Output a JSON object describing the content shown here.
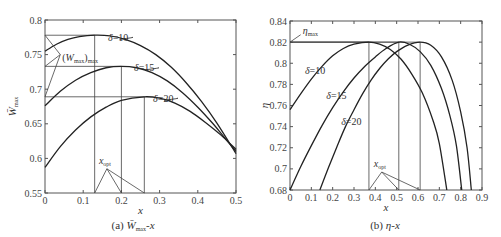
{
  "chart_data": [
    {
      "type": "line",
      "panel": "a",
      "caption": "(a) W̄max-x",
      "caption_parts": {
        "prefix": "(a) ",
        "var": "W̄",
        "sub": "max",
        "suffix": "-x"
      },
      "xlabel": "x",
      "ylabel": "W̄max",
      "ylabel_parts": {
        "var": "W̄",
        "sub": "max"
      },
      "xlim": [
        0,
        0.5
      ],
      "ylim": [
        0.55,
        0.8
      ],
      "xticks": [
        0,
        0.1,
        0.2,
        0.3,
        0.4,
        0.5
      ],
      "xtick_labels": [
        "0",
        "0.1",
        "0.2",
        "0.3",
        "0.4",
        "0.5"
      ],
      "yticks": [
        0.55,
        0.6,
        0.65,
        0.7,
        0.75,
        0.8
      ],
      "ytick_labels": [
        "0.55",
        "0.6",
        "0.65",
        "0.7",
        "0.75",
        "0.8"
      ],
      "grid": false,
      "series": [
        {
          "name": "δ=10",
          "x": [
            0,
            0.03,
            0.06,
            0.09,
            0.13,
            0.17,
            0.21,
            0.25,
            0.29,
            0.33,
            0.37,
            0.41,
            0.45,
            0.5
          ],
          "y": [
            0.755,
            0.765,
            0.772,
            0.776,
            0.778,
            0.777,
            0.772,
            0.763,
            0.75,
            0.732,
            0.709,
            0.682,
            0.651,
            0.607
          ]
        },
        {
          "name": "δ=15",
          "x": [
            0,
            0.04,
            0.08,
            0.12,
            0.16,
            0.2,
            0.24,
            0.28,
            0.32,
            0.36,
            0.4,
            0.44,
            0.47,
            0.5
          ],
          "y": [
            0.676,
            0.697,
            0.713,
            0.724,
            0.731,
            0.733,
            0.731,
            0.724,
            0.712,
            0.695,
            0.674,
            0.65,
            0.63,
            0.61
          ]
        },
        {
          "name": "δ=20",
          "x": [
            0,
            0.04,
            0.08,
            0.12,
            0.16,
            0.2,
            0.26,
            0.3,
            0.34,
            0.38,
            0.42,
            0.46,
            0.5
          ],
          "y": [
            0.587,
            0.617,
            0.641,
            0.66,
            0.674,
            0.684,
            0.689,
            0.687,
            0.68,
            0.668,
            0.652,
            0.634,
            0.613
          ]
        }
      ],
      "peaks": [
        {
          "series": "δ=10",
          "x": 0.13,
          "y": 0.778
        },
        {
          "series": "δ=15",
          "x": 0.2,
          "y": 0.733
        },
        {
          "series": "δ=20",
          "x": 0.26,
          "y": 0.689
        }
      ],
      "series_labels": [
        {
          "text": "δ=10",
          "x": 0.165,
          "y": 0.775,
          "leader_to": [
            0.195,
            0.772
          ]
        },
        {
          "text": "δ=15",
          "x": 0.233,
          "y": 0.731,
          "leader_to": [
            0.262,
            0.728
          ]
        },
        {
          "text": "δ=20",
          "x": 0.283,
          "y": 0.687,
          "leader_to": [
            0.312,
            0.684
          ]
        }
      ],
      "annotations": [
        {
          "text": "(Wmax)max",
          "parts": {
            "open": "(",
            "var": "W",
            "sub1": "max",
            "close": ")",
            "sub2": "max"
          },
          "x": 0.045,
          "y": 0.745,
          "pointer": [
            0.04,
            0.75
          ],
          "targets": [
            [
              0,
              0.778
            ],
            [
              0,
              0.733
            ],
            [
              0,
              0.689
            ]
          ]
        },
        {
          "text": "xopt",
          "parts": {
            "var": "x",
            "sub": "opt"
          },
          "x": 0.15,
          "y": 0.59,
          "pointer": [
            0.162,
            0.585
          ],
          "targets": [
            [
              0.13,
              0.55
            ],
            [
              0.2,
              0.55
            ],
            [
              0.26,
              0.55
            ]
          ]
        }
      ]
    },
    {
      "type": "line",
      "panel": "b",
      "caption": "(b) η-x",
      "caption_parts": {
        "prefix": "(b) ",
        "var": "η",
        "suffix": "-x"
      },
      "xlabel": "x",
      "ylabel": "η",
      "xlim": [
        0,
        0.9
      ],
      "ylim": [
        0.68,
        0.84
      ],
      "xticks": [
        0,
        0.1,
        0.2,
        0.3,
        0.4,
        0.5,
        0.6,
        0.7,
        0.8,
        0.9
      ],
      "xtick_labels": [
        "0",
        "0.1",
        "0.2",
        "0.3",
        "0.4",
        "0.5",
        "0.6",
        "0.7",
        "0.8",
        "0.9"
      ],
      "yticks": [
        0.68,
        0.7,
        0.72,
        0.74,
        0.76,
        0.78,
        0.8,
        0.82,
        0.84
      ],
      "ytick_labels": [
        "0.68",
        "0.7",
        "0.72",
        "0.74",
        "0.76",
        "0.78",
        "0.8",
        "0.82",
        "0.84"
      ],
      "grid": false,
      "series": [
        {
          "name": "δ=10",
          "x": [
            0,
            0.05,
            0.1,
            0.15,
            0.2,
            0.25,
            0.3,
            0.37,
            0.42,
            0.47,
            0.52,
            0.57,
            0.62,
            0.67,
            0.7,
            0.735
          ],
          "y": [
            0.756,
            0.771,
            0.785,
            0.797,
            0.807,
            0.814,
            0.818,
            0.82,
            0.818,
            0.813,
            0.804,
            0.79,
            0.772,
            0.746,
            0.724,
            0.68
          ]
        },
        {
          "name": "δ=15",
          "x": [
            0,
            0.05,
            0.1,
            0.15,
            0.2,
            0.25,
            0.3,
            0.35,
            0.4,
            0.45,
            0.51,
            0.56,
            0.61,
            0.66,
            0.71,
            0.75,
            0.78,
            0.805
          ],
          "y": [
            0.68,
            0.702,
            0.722,
            0.741,
            0.758,
            0.773,
            0.786,
            0.797,
            0.806,
            0.814,
            0.82,
            0.818,
            0.811,
            0.798,
            0.776,
            0.75,
            0.722,
            0.68
          ]
        },
        {
          "name": "δ=20",
          "x": [
            0.14,
            0.18,
            0.22,
            0.26,
            0.3,
            0.34,
            0.38,
            0.42,
            0.46,
            0.5,
            0.55,
            0.61,
            0.66,
            0.71,
            0.76,
            0.8,
            0.83,
            0.85
          ],
          "y": [
            0.68,
            0.701,
            0.721,
            0.74,
            0.756,
            0.771,
            0.784,
            0.795,
            0.804,
            0.811,
            0.817,
            0.82,
            0.817,
            0.806,
            0.784,
            0.754,
            0.72,
            0.68
          ]
        }
      ],
      "peaks": [
        {
          "series": "δ=10",
          "x": 0.37,
          "y": 0.82
        },
        {
          "series": "δ=15",
          "x": 0.51,
          "y": 0.82
        },
        {
          "series": "δ=20",
          "x": 0.61,
          "y": 0.82
        }
      ],
      "series_labels": [
        {
          "text": "δ=10",
          "x": 0.07,
          "y": 0.793
        },
        {
          "text": "δ=15",
          "x": 0.17,
          "y": 0.769
        },
        {
          "text": "δ=20",
          "x": 0.24,
          "y": 0.745
        }
      ],
      "annotations": [
        {
          "text": "ηmax",
          "parts": {
            "var": "η",
            "sub": "max"
          },
          "x": 0.055,
          "y": 0.831,
          "pointer": [
            0.05,
            0.827
          ],
          "targets": [
            [
              0,
              0.82
            ]
          ]
        },
        {
          "text": "xopt",
          "parts": {
            "var": "x",
            "sub": "opt"
          },
          "x": 0.4,
          "y": 0.702,
          "pointer": [
            0.43,
            0.697
          ],
          "targets": [
            [
              0.37,
              0.68
            ],
            [
              0.51,
              0.68
            ],
            [
              0.61,
              0.68
            ]
          ]
        }
      ]
    }
  ],
  "colors": {
    "curve": "#222222",
    "axis": "#555555",
    "guide": "#444444",
    "text": "#333333"
  }
}
